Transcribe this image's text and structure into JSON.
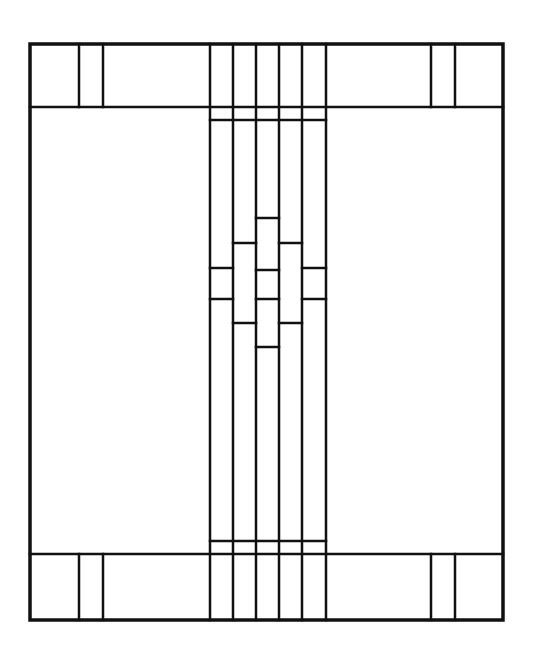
{
  "colors": {
    "lead": "#111111",
    "glass": "#ffffff"
  },
  "design": {
    "frame": "outer-rectangle",
    "bands": [
      "top-border-band",
      "central-vertical-strip",
      "bottom-border-band"
    ],
    "center_columns": 5,
    "side_mullions_per_band": 2
  }
}
